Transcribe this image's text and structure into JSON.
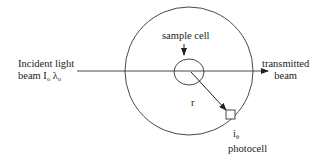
{
  "labels": {
    "incident_line1": "Incident light",
    "incident_line2_prefix": "beam I",
    "incident_sub1": "o",
    "incident_lambda": "λ",
    "incident_sub2": "o",
    "sample_cell": "sample cell",
    "transmitted_line1": "transmitted",
    "transmitted_line2": "beam",
    "radius": "r",
    "intensity_main": "i",
    "intensity_sub": "θ",
    "photocell": "photocell"
  },
  "colors": {
    "stroke": "#333333",
    "text": "#222222",
    "background": "#ffffff"
  }
}
